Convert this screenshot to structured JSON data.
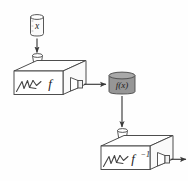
{
  "figure": {
    "type": "process-flow-diagram",
    "background_color": "#fefefe",
    "line_color": "#3a3a3a",
    "fill_white": "#ffffff",
    "fill_gray": "#969696",
    "fill_light": "#f2f2f2"
  },
  "nodes": {
    "input_can": {
      "label": "x",
      "shape": "cylinder",
      "fill": "#fbfbfb",
      "role": "input-container"
    },
    "machine_forward": {
      "label": "f",
      "shape": "box-3d",
      "fill": "#ffffff",
      "role": "function-machine",
      "has_hopper": true,
      "has_crank": true,
      "has_spout": true
    },
    "middle_can": {
      "label": "f(x)",
      "shape": "cylinder",
      "fill": "#969696",
      "role": "intermediate-container"
    },
    "machine_inverse": {
      "label": "f",
      "exponent": "−1",
      "shape": "box-3d",
      "fill": "#ffffff",
      "role": "inverse-function-machine",
      "has_hopper": true,
      "has_crank": true,
      "has_spout": true
    }
  },
  "arrows": [
    {
      "name": "x-to-machine",
      "direction": "down",
      "from": "input_can",
      "to": "machine_forward"
    },
    {
      "name": "machine-to-fx",
      "direction": "right",
      "from": "machine_forward",
      "to": "middle_can"
    },
    {
      "name": "fx-to-inverse",
      "direction": "down",
      "from": "middle_can",
      "to": "machine_inverse"
    },
    {
      "name": "inverse-output",
      "direction": "right",
      "from": "machine_inverse",
      "to": "output"
    }
  ]
}
